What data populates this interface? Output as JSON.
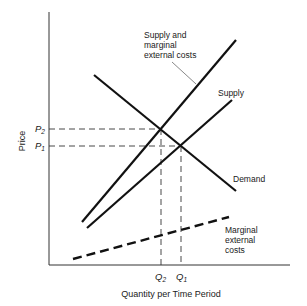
{
  "diagram": {
    "type": "supply-demand with externality",
    "axes": {
      "y_label": "Price",
      "x_label": "Quantity per Time Period"
    },
    "curves": {
      "supply_mec": {
        "label_lines": [
          "Supply and",
          "marginal",
          "external costs"
        ]
      },
      "supply": {
        "label": "Supply"
      },
      "demand": {
        "label": "Demand"
      },
      "mec": {
        "label_lines": [
          "Marginal",
          "external",
          "costs"
        ]
      }
    },
    "price_marks": [
      {
        "symbol": "P",
        "subscript": "2"
      },
      {
        "symbol": "P",
        "subscript": "1"
      }
    ],
    "quantity_marks": [
      {
        "symbol": "Q",
        "subscript": "2"
      },
      {
        "symbol": "Q",
        "subscript": "1"
      }
    ],
    "colors": {
      "line": "#111111",
      "text": "#1a1a1a",
      "axis": "#333333"
    }
  }
}
